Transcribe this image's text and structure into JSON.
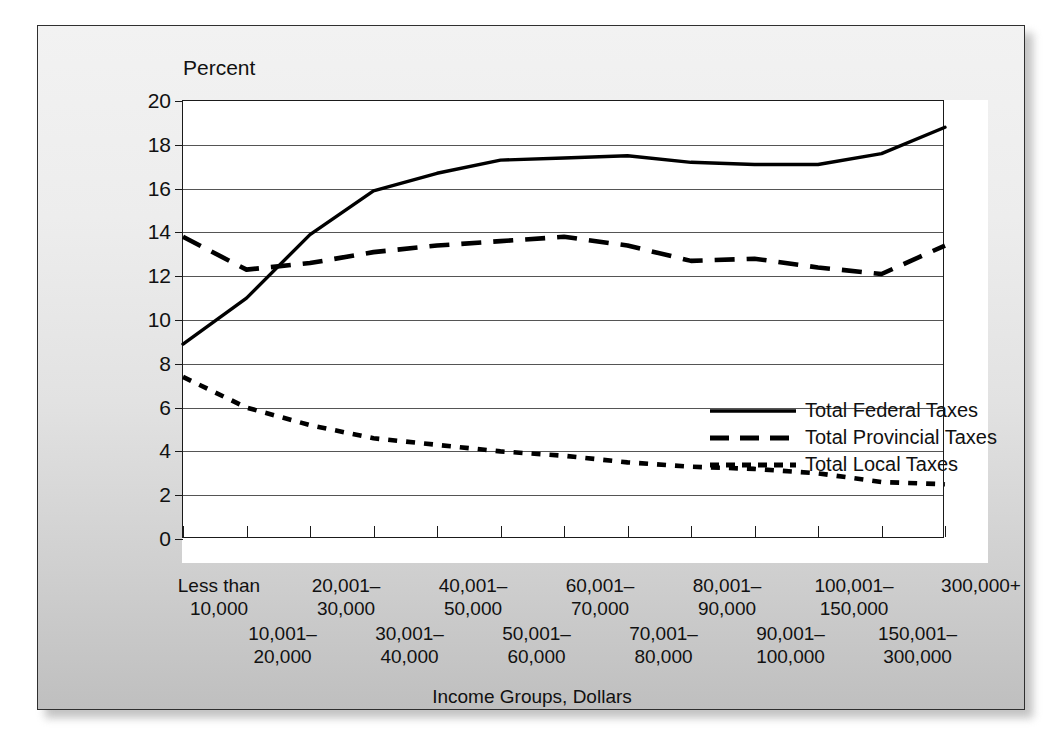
{
  "figure": {
    "percent_label": "Percent",
    "xaxis_title": "Income Groups, Dollars"
  },
  "chart_data": {
    "type": "line",
    "title": "",
    "xlabel": "Income Groups, Dollars",
    "ylabel": "Percent",
    "ylim": [
      0,
      20
    ],
    "ytick_labels": [
      "0",
      "2",
      "4",
      "6",
      "8",
      "10",
      "12",
      "14",
      "16",
      "18",
      "20"
    ],
    "yticks": [
      0,
      2,
      4,
      6,
      8,
      10,
      12,
      14,
      16,
      18,
      20
    ],
    "grid": "horizontal",
    "legend_position": "inside-right",
    "categories": [
      "Less than 10,000",
      "10,001-20,000",
      "20,001-30,000",
      "30,001-40,000",
      "40,001-50,000",
      "50,001-60,000",
      "60,001-70,000",
      "70,001-80,000",
      "80,001-90,000",
      "90,001-100,000",
      "100,001-150,000",
      "150,001-300,000",
      "300,000+"
    ],
    "category_labels_top": [
      {
        "index": 0,
        "line1": "Less than",
        "line2": "10,000"
      },
      {
        "index": 2,
        "line1": "20,001–",
        "line2": "30,000"
      },
      {
        "index": 4,
        "line1": "40,001–",
        "line2": "50,000"
      },
      {
        "index": 6,
        "line1": "60,001–",
        "line2": "70,000"
      },
      {
        "index": 8,
        "line1": "80,001–",
        "line2": "90,000"
      },
      {
        "index": 10,
        "line1": "100,001–",
        "line2": "150,000"
      },
      {
        "index": 12,
        "line1": "300,000+",
        "line2": ""
      }
    ],
    "category_labels_bottom": [
      {
        "index": 1,
        "line1": "10,001–",
        "line2": "20,000"
      },
      {
        "index": 3,
        "line1": "30,001–",
        "line2": "40,000"
      },
      {
        "index": 5,
        "line1": "50,001–",
        "line2": "60,000"
      },
      {
        "index": 7,
        "line1": "70,001–",
        "line2": "80,000"
      },
      {
        "index": 9,
        "line1": "90,001–",
        "line2": "100,000"
      },
      {
        "index": 11,
        "line1": "150,001–",
        "line2": "300,000"
      }
    ],
    "series": [
      {
        "name": "Total Federal Taxes",
        "style": "solid",
        "color": "#000000",
        "values": [
          8.9,
          11.0,
          13.9,
          15.9,
          16.7,
          17.3,
          17.4,
          17.5,
          17.2,
          17.1,
          17.1,
          17.6,
          18.8
        ]
      },
      {
        "name": "Total Provincial Taxes",
        "style": "dashed",
        "color": "#000000",
        "values": [
          13.8,
          12.3,
          12.6,
          13.1,
          13.4,
          13.6,
          13.8,
          13.4,
          12.7,
          12.8,
          12.4,
          12.1,
          13.4
        ]
      },
      {
        "name": "Total Local Taxes",
        "style": "dotted",
        "color": "#000000",
        "values": [
          7.4,
          6.0,
          5.2,
          4.6,
          4.3,
          4.0,
          3.8,
          3.5,
          3.3,
          3.2,
          3.0,
          2.6,
          2.5
        ]
      }
    ]
  },
  "legend": {
    "items": [
      {
        "label": "Total Federal Taxes",
        "style": "solid"
      },
      {
        "label": "Total Provincial Taxes",
        "style": "dashed"
      },
      {
        "label": "Total Local Taxes",
        "style": "dotted"
      }
    ]
  }
}
